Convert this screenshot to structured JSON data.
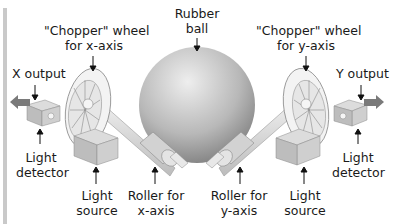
{
  "diagram": {
    "labels": {
      "rubber_ball": [
        "Rubber",
        "ball"
      ],
      "chopper_x": [
        "\"Chopper\" wheel",
        "for x-axis"
      ],
      "chopper_y": [
        "\"Chopper\" wheel",
        "for y-axis"
      ],
      "x_output": "X output",
      "y_output": "Y output",
      "light_detector_left": [
        "Light",
        "detector"
      ],
      "light_source_left": [
        "Light",
        "source"
      ],
      "roller_x": [
        "Roller for",
        "x-axis"
      ],
      "roller_y": [
        "Roller for",
        "y-axis"
      ],
      "light_source_right": [
        "Light",
        "source"
      ],
      "light_detector_right": [
        "Light",
        "detector"
      ]
    },
    "colors": {
      "ball_light": "#e6e6e6",
      "ball_dark": "#8e8e8e",
      "box_face": "#bdbdbd",
      "box_top": "#dadada",
      "wheel": "#efefef",
      "arrow_fill": "#7a7a7a",
      "border": "#c9c9c9"
    }
  }
}
